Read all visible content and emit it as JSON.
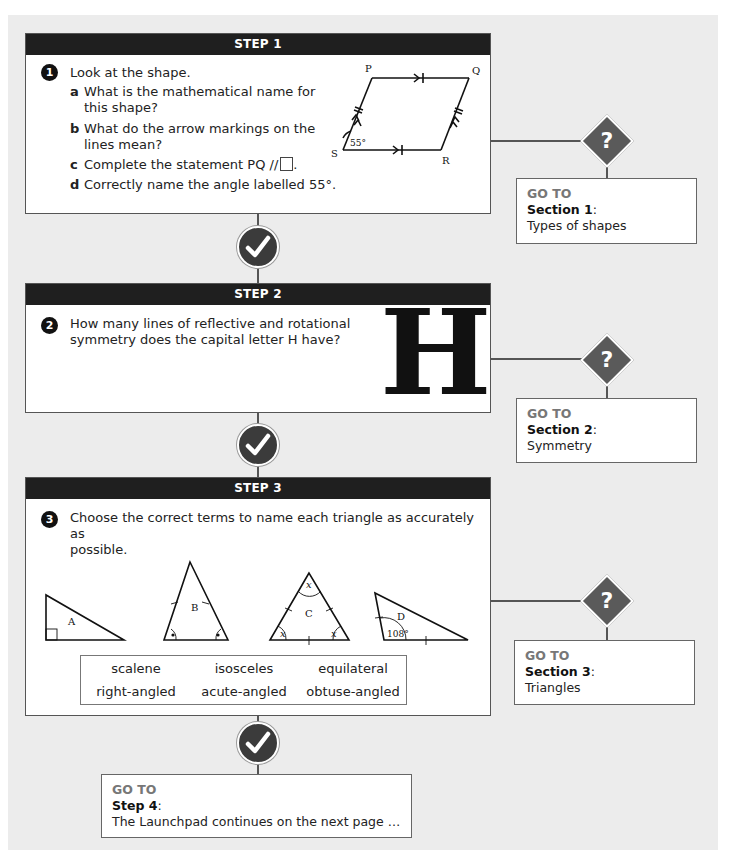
{
  "steps": [
    {
      "header": "STEP 1",
      "number": "1",
      "question": "Look at the shape.",
      "parts": [
        {
          "letter": "a",
          "line1": "What is the mathematical name for",
          "line2": "this shape?"
        },
        {
          "letter": "b",
          "line1": "What do the arrow markings on the",
          "line2": "lines mean?"
        },
        {
          "letter": "c",
          "line1": "Complete the statement PQ //",
          "line2": ""
        },
        {
          "letter": "d",
          "line1": "Correctly name the angle labelled 55°.",
          "line2": ""
        }
      ],
      "diagram": {
        "vertices": [
          "P",
          "Q",
          "R",
          "S"
        ],
        "angle_label": "55°"
      },
      "goto": {
        "label": "GO TO",
        "target": "Section 1",
        "desc": "Types of shapes"
      }
    },
    {
      "header": "STEP 2",
      "number": "2",
      "question_line1": "How many lines of reflective and rotational",
      "question_line2": "symmetry does the capital letter H have?",
      "letter": "H",
      "goto": {
        "label": "GO TO",
        "target": "Section 2",
        "desc": "Symmetry"
      }
    },
    {
      "header": "STEP 3",
      "number": "3",
      "question_line1": "Choose the correct terms to name each triangle as accurately as",
      "question_line2": "possible.",
      "triangles": {
        "A": "A",
        "B": "B",
        "C": "C",
        "D": "D",
        "x": "x",
        "angle_D": "108°"
      },
      "terms": [
        "scalene",
        "isosceles",
        "equilateral",
        "right-angled",
        "acute-angled",
        "obtuse-angled"
      ],
      "goto": {
        "label": "GO TO",
        "target": "Section 3",
        "desc": "Triangles"
      }
    }
  ],
  "final_goto": {
    "label": "GO TO",
    "target": "Step 4",
    "desc": "The Launchpad continues on the next page …"
  },
  "icons": {
    "check": "check-circle-icon",
    "question": "question-diamond-icon"
  },
  "colors": {
    "header": "#1f1f1f",
    "background": "#ececec",
    "diamond": "#5a5a5a",
    "goto_label": "#777777"
  }
}
